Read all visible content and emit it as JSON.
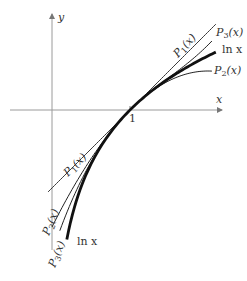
{
  "diagram": {
    "axes": {
      "x_label": "x",
      "y_label": "y",
      "tick_label_x1": "1",
      "origin_px": [
        52,
        110
      ],
      "unit_px": 78,
      "x_axis_range_px": [
        10,
        222
      ],
      "y_axis_range_px": [
        14,
        250
      ]
    },
    "curves": [
      {
        "id": "ln",
        "label": "ln x",
        "formula": "ln(x)",
        "stroke": "#111111",
        "width": 2.8,
        "x_range": [
          0.19,
          2.1
        ]
      },
      {
        "id": "P1",
        "label": "P1(x)",
        "formula": "(x-1)",
        "stroke": "#222222",
        "width": 0.9,
        "x_range": [
          -0.05,
          2.1
        ]
      },
      {
        "id": "P2",
        "label": "P2(x)",
        "formula": "(x-1)-(x-1)^2/2",
        "stroke": "#222222",
        "width": 1.0,
        "x_range": [
          0.0,
          2.05
        ]
      },
      {
        "id": "P3",
        "label": "P3(x)",
        "formula": "(x-1)-(x-1)^2/2+(x-1)^3/3",
        "stroke": "#222222",
        "width": 1.0,
        "x_range": [
          0.1,
          2.05
        ]
      }
    ],
    "labels": {
      "P1_top": {
        "text_p": "P",
        "sub": "1",
        "arg": "(x)"
      },
      "P3_top": {
        "text_p": "P",
        "sub": "3",
        "arg": "(x)"
      },
      "ln_top": "ln x",
      "P2_top": {
        "text_p": "P",
        "sub": "2",
        "arg": "(x)"
      },
      "P1_bottom": {
        "text_p": "P",
        "sub": "1",
        "arg": "(x)"
      },
      "P2_bottom": {
        "text_p": "P",
        "sub": "2",
        "arg": "(x)"
      },
      "P3_bottom": {
        "text_p": "P",
        "sub": "3",
        "arg": "(x)"
      },
      "ln_bottom": "ln x"
    },
    "colors": {
      "axis": "#9a9a9a",
      "curve": "#1a1a1a",
      "text": "#333333"
    }
  }
}
